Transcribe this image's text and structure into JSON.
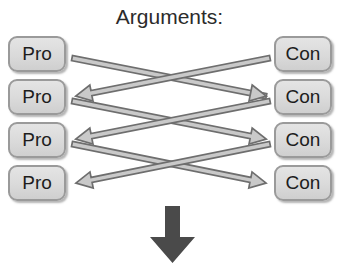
{
  "diagram": {
    "title": "Arguments:",
    "type": "argument-map",
    "colors": {
      "background": "#ffffff",
      "node_fill": "#dadada",
      "node_border": "#9a9a9a",
      "node_text": "#1d1d1d",
      "title_text": "#2b2b2b",
      "edge_stroke": "#6e6e6e",
      "edge_fill": "#c9c9c9",
      "down_arrow": "#4a4a4a"
    },
    "left_column": {
      "name": "pro-column",
      "nodes": [
        {
          "id": "pro-1",
          "label": "Pro",
          "x": 8,
          "y": 36
        },
        {
          "id": "pro-2",
          "label": "Pro",
          "x": 8,
          "y": 79
        },
        {
          "id": "pro-3",
          "label": "Pro",
          "x": 8,
          "y": 122
        },
        {
          "id": "pro-4",
          "label": "Pro",
          "x": 8,
          "y": 165
        }
      ]
    },
    "right_column": {
      "name": "con-column",
      "nodes": [
        {
          "id": "con-1",
          "label": "Con",
          "x": 274,
          "y": 36
        },
        {
          "id": "con-2",
          "label": "Con",
          "x": 274,
          "y": 79
        },
        {
          "id": "con-3",
          "label": "Con",
          "x": 274,
          "y": 122
        },
        {
          "id": "con-4",
          "label": "Con",
          "x": 274,
          "y": 165
        }
      ]
    },
    "edges": [
      {
        "id": "edge-pro1-con2",
        "from": "pro-1",
        "to": "con-2",
        "style": "double-arrow",
        "x1": 72,
        "y1": 58,
        "x2": 270,
        "y2": 97
      },
      {
        "id": "edge-con1-pro2",
        "from": "con-1",
        "to": "pro-2",
        "style": "double-arrow",
        "x1": 270,
        "y1": 58,
        "x2": 72,
        "y2": 97
      },
      {
        "id": "edge-pro2-con3",
        "from": "pro-2",
        "to": "con-3",
        "style": "double-arrow",
        "x1": 72,
        "y1": 101,
        "x2": 270,
        "y2": 140
      },
      {
        "id": "edge-con2-pro3",
        "from": "con-2",
        "to": "pro-3",
        "style": "double-arrow",
        "x1": 270,
        "y1": 101,
        "x2": 72,
        "y2": 140
      },
      {
        "id": "edge-pro3-con4",
        "from": "pro-3",
        "to": "con-4",
        "style": "double-arrow",
        "x1": 72,
        "y1": 144,
        "x2": 270,
        "y2": 184
      },
      {
        "id": "edge-con3-pro4",
        "from": "con-3",
        "to": "pro-4",
        "style": "double-arrow",
        "x1": 270,
        "y1": 144,
        "x2": 72,
        "y2": 184
      }
    ],
    "down_arrow": {
      "name": "down-arrow",
      "direction": "down"
    }
  }
}
